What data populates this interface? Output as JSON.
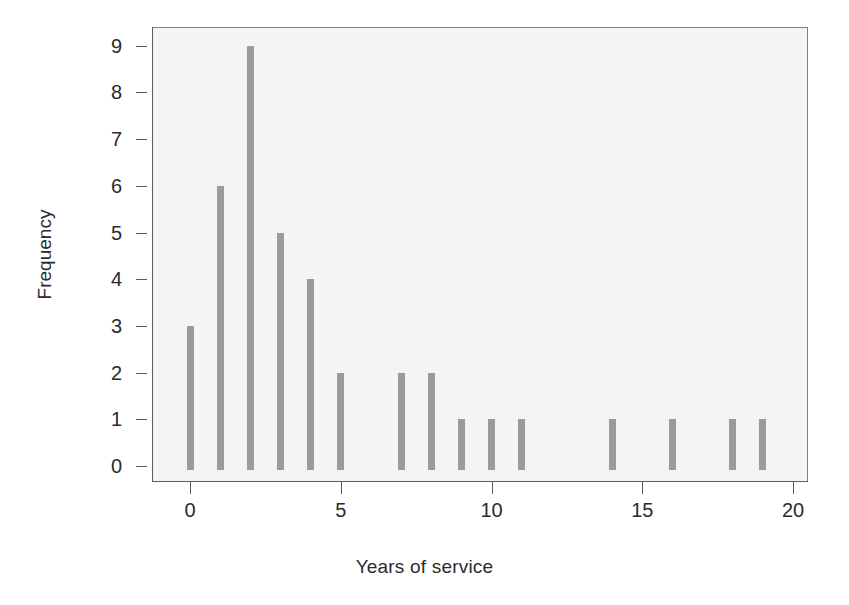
{
  "chart_data": {
    "type": "bar",
    "title": "",
    "subtitle": "",
    "xlabel": "Years of service",
    "ylabel": "Frequency",
    "categories": [
      0,
      1,
      2,
      3,
      4,
      5,
      6,
      7,
      8,
      9,
      10,
      11,
      12,
      13,
      14,
      15,
      16,
      17,
      18,
      19,
      20
    ],
    "values": [
      3,
      6,
      9,
      5,
      4,
      2,
      0,
      2,
      2,
      1,
      1,
      1,
      0,
      0,
      1,
      0,
      1,
      0,
      1,
      1,
      0
    ],
    "x": [
      0,
      1,
      2,
      3,
      4,
      5,
      6,
      7,
      8,
      9,
      10,
      11,
      12,
      13,
      14,
      15,
      16,
      17,
      18,
      19,
      20
    ],
    "xlim": [
      -0.6,
      20.5
    ],
    "ylim": [
      0,
      9.4
    ],
    "xticks": [
      0,
      5,
      10,
      15,
      20
    ],
    "xticklabels": [
      "0",
      "5",
      "10",
      "15",
      "20"
    ],
    "yticks": [
      0,
      1,
      2,
      3,
      4,
      5,
      6,
      7,
      8,
      9
    ],
    "yticklabels": [
      "0",
      "1",
      "2",
      "3",
      "4",
      "5",
      "6",
      "7",
      "8",
      "9"
    ],
    "grid": false,
    "legend": null,
    "bar_color": "#9b9b9b",
    "panel_background": "#f4f4f4",
    "panel_border_color": "#7f7f7f",
    "axis_color": "#5c5c5c",
    "text_color": "#2b2b2b",
    "annotations": []
  },
  "figure": {
    "background": "#ffffff",
    "width": 849,
    "height": 605
  }
}
